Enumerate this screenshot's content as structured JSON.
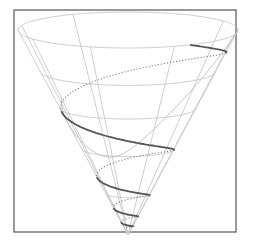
{
  "figure": {
    "type": "3d-cone-with-helix",
    "frame": {
      "x": 14,
      "y": 10,
      "w": 222,
      "h": 222,
      "stroke": "#555555"
    },
    "cone": {
      "apex": [
        128,
        235
      ],
      "top_center": [
        128,
        30
      ],
      "top_rx": 110,
      "top_ry": 18,
      "grid_color": "#c8c8c8",
      "rings": [
        0.2,
        0.42,
        0.62,
        0.8
      ],
      "meridians_deg": [
        -150,
        -105,
        -60,
        -20,
        25,
        75,
        120
      ]
    },
    "helix": {
      "front_color": "#555555",
      "back_color": "#777777",
      "turns": 4.6
    },
    "guide_curve": {
      "color": "#bdbdbd"
    }
  }
}
